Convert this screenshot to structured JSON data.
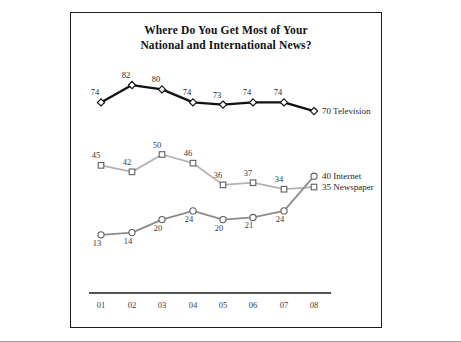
{
  "chart_data": {
    "type": "line",
    "title": "Where Do You Get Most of Your National and International News?",
    "title_line1": "Where Do You Get Most of Your",
    "title_line2": "National and International News?",
    "xlabel": "",
    "ylabel": "",
    "categories": [
      "01",
      "02",
      "03",
      "04",
      "05",
      "06",
      "07",
      "08"
    ],
    "ylim": [
      0,
      90
    ],
    "grid": false,
    "legend_position": "right-end-of-line",
    "series": [
      {
        "name": "Television",
        "marker": "diamond",
        "color": "#111111",
        "values": [
          74,
          82,
          80,
          74,
          73,
          74,
          74,
          70
        ],
        "end_label": "70 Television"
      },
      {
        "name": "Newspaper",
        "marker": "square",
        "color": "#b3b3b3",
        "values": [
          45,
          42,
          50,
          46,
          36,
          37,
          34,
          35
        ],
        "end_label": "35 Newspaper"
      },
      {
        "name": "Internet",
        "marker": "circle",
        "color": "#8c8c8c",
        "values": [
          13,
          14,
          20,
          24,
          20,
          21,
          24,
          40
        ],
        "end_label": "40 Internet"
      }
    ]
  },
  "chart": {
    "title_line1": "Where Do You Get Most of Your",
    "title_line2": "National and International News?"
  }
}
